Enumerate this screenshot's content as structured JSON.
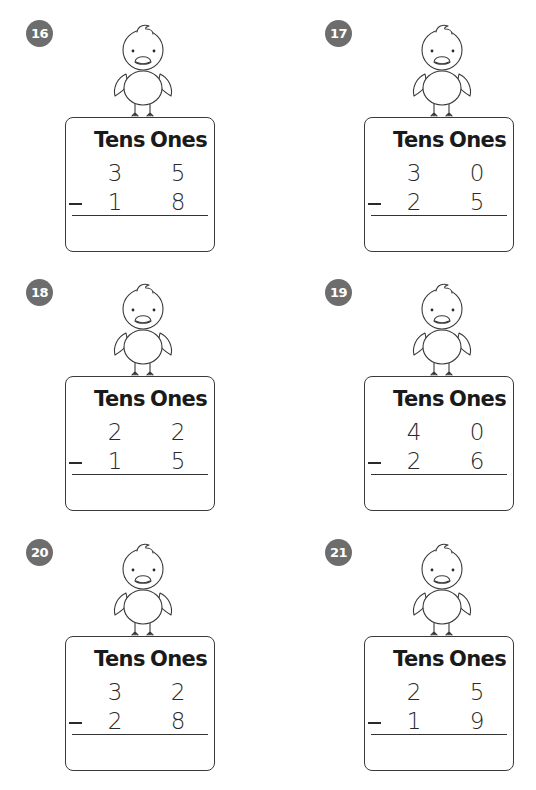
{
  "worksheet": {
    "column_headers": {
      "tens": "Tens",
      "ones": "Ones"
    },
    "operator": "−",
    "problems": [
      {
        "number": "16",
        "top": {
          "tens": "3",
          "ones": "5"
        },
        "bottom": {
          "tens": "1",
          "ones": "8"
        },
        "answer": ""
      },
      {
        "number": "17",
        "top": {
          "tens": "3",
          "ones": "0"
        },
        "bottom": {
          "tens": "2",
          "ones": "5"
        },
        "answer": ""
      },
      {
        "number": "18",
        "top": {
          "tens": "2",
          "ones": "2"
        },
        "bottom": {
          "tens": "1",
          "ones": "5"
        },
        "answer": ""
      },
      {
        "number": "19",
        "top": {
          "tens": "4",
          "ones": "0"
        },
        "bottom": {
          "tens": "2",
          "ones": "6"
        },
        "answer": ""
      },
      {
        "number": "20",
        "top": {
          "tens": "3",
          "ones": "2"
        },
        "bottom": {
          "tens": "2",
          "ones": "8"
        },
        "answer": ""
      },
      {
        "number": "21",
        "top": {
          "tens": "2",
          "ones": "5"
        },
        "bottom": {
          "tens": "1",
          "ones": "9"
        },
        "answer": ""
      }
    ]
  },
  "colors": {
    "badge": "#6d6d6d",
    "ink": "#2a2a2a",
    "border": "#3a3a3a"
  },
  "icons": {
    "mascot": "duck-icon"
  }
}
